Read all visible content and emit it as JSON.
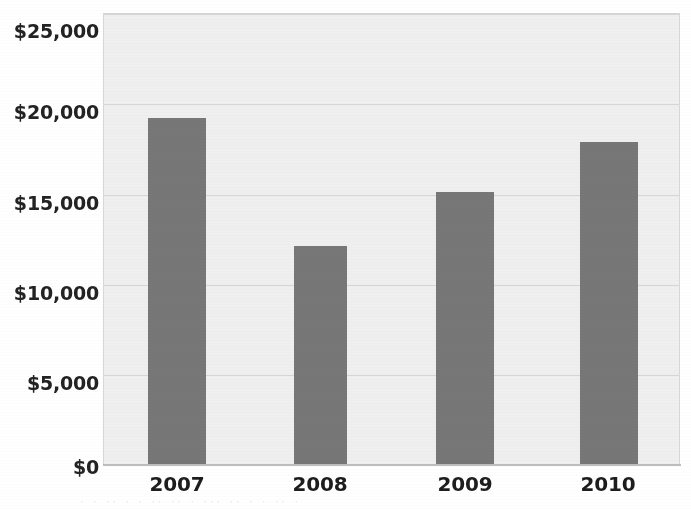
{
  "chart_data": {
    "type": "bar",
    "title": "",
    "subtitle": "",
    "xlabel": "",
    "ylabel": "",
    "categories": [
      "2007",
      "2008",
      "2009",
      "2010"
    ],
    "values": [
      19200,
      12100,
      15100,
      17900
    ],
    "series": [
      {
        "name": "",
        "values": [
          19200,
          12100,
          15100,
          17900
        ]
      }
    ],
    "ylim": [
      0,
      25000
    ],
    "y_ticks": [
      0,
      5000,
      10000,
      15000,
      20000,
      25000
    ],
    "y_tick_labels": [
      "$0",
      "$5,000",
      "$10,000",
      "$15,000",
      "$20,000",
      "$25,000"
    ],
    "x_tick_labels": [
      "2007",
      "2008",
      "2009",
      "2010"
    ],
    "grid": true,
    "grid_axis": "y",
    "legend": false,
    "legend_position": "none",
    "bar_color": "#777777",
    "plot_background": "#efefef",
    "gridline_color": "#d5d5d5",
    "axis_color": "#bdbdbd",
    "page_background": "#ffffff",
    "annotations": []
  },
  "scan_artifact": {
    "bleed_text": "· ·  ·· · ·  ·· ··  ·  ··· ·· ·  ·  ·· ·"
  }
}
